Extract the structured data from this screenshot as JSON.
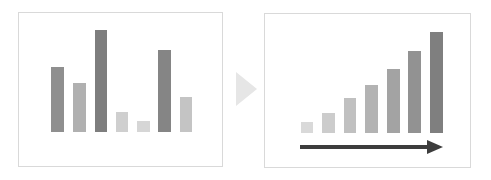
{
  "diagram": {
    "left_panel": {
      "label": "Unsorted bars",
      "frame": {
        "x": 18,
        "y": 12,
        "w": 205,
        "h": 155
      },
      "baseline_y": 132,
      "bars": [
        {
          "x": 51,
          "w": 13,
          "top": 67,
          "color": "#8f8f8f"
        },
        {
          "x": 73,
          "w": 13,
          "top": 83,
          "color": "#b0b0b0"
        },
        {
          "x": 95,
          "w": 12,
          "top": 30,
          "color": "#7e7e7e"
        },
        {
          "x": 116,
          "w": 12,
          "top": 112,
          "color": "#cfcfcf"
        },
        {
          "x": 137,
          "w": 13,
          "top": 121,
          "color": "#d6d6d6"
        },
        {
          "x": 158,
          "w": 13,
          "top": 50,
          "color": "#858585"
        },
        {
          "x": 180,
          "w": 12,
          "top": 97,
          "color": "#c4c4c4"
        }
      ]
    },
    "transition_arrow": {
      "x": 236,
      "y": 72,
      "w": 21,
      "h": 34,
      "color": "#e6e6e6"
    },
    "right_panel": {
      "label": "Sorted ascending bars",
      "frame": {
        "x": 264,
        "y": 13,
        "w": 207,
        "h": 155
      },
      "baseline_y": 133,
      "bars": [
        {
          "x": 301,
          "w": 12,
          "top": 122,
          "color": "#d9d9d9"
        },
        {
          "x": 322,
          "w": 13,
          "top": 113,
          "color": "#cccccc"
        },
        {
          "x": 344,
          "w": 12,
          "top": 98,
          "color": "#c0c0c0"
        },
        {
          "x": 365,
          "w": 13,
          "top": 85,
          "color": "#b3b3b3"
        },
        {
          "x": 387,
          "w": 13,
          "top": 69,
          "color": "#a3a3a3"
        },
        {
          "x": 408,
          "w": 13,
          "top": 51,
          "color": "#929292"
        },
        {
          "x": 430,
          "w": 13,
          "top": 32,
          "color": "#7f7f7f"
        }
      ],
      "direction_arrow": {
        "x1": 300,
        "x2": 443,
        "y": 147,
        "color": "#3d3d3d"
      }
    }
  }
}
